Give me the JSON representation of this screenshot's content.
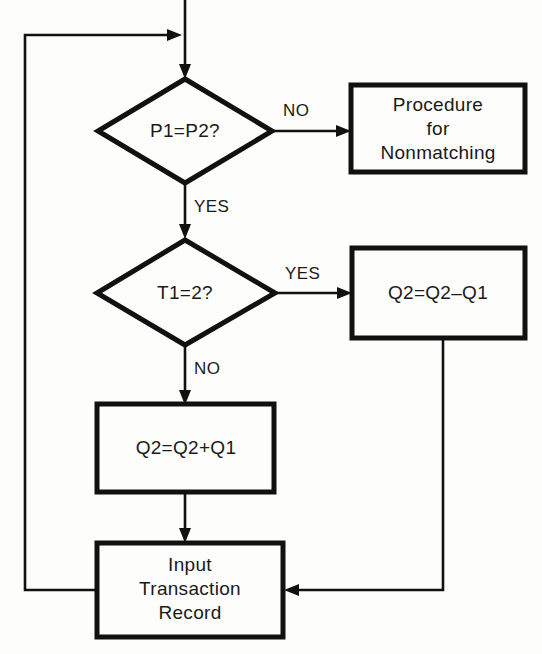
{
  "diagram": {
    "colors": {
      "background": "#fdfdfb",
      "stroke": "#111111",
      "text": "#1a1a1a"
    },
    "nodes": {
      "decision_p1p2": {
        "type": "decision",
        "label": "P1=P2?"
      },
      "proc_nonmatching": {
        "type": "process",
        "line1": "Procedure",
        "line2": "for",
        "line3": "Nonmatching"
      },
      "decision_t1": {
        "type": "decision",
        "label": "T1=2?"
      },
      "q2_minus": {
        "type": "process",
        "label": "Q2=Q2–Q1"
      },
      "q2_plus": {
        "type": "process",
        "label": "Q2=Q2+Q1"
      },
      "input_transaction": {
        "type": "process",
        "line1": "Input",
        "line2": "Transaction",
        "line3": "Record"
      }
    },
    "edge_labels": {
      "p1p2_no": "NO",
      "p1p2_yes": "YES",
      "t1_yes": "YES",
      "t1_no": "NO"
    }
  }
}
